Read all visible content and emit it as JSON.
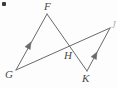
{
  "figure": {
    "type": "geometry-diagram",
    "canvas": {
      "width": 117,
      "height": 88
    },
    "background_color": "#fdfdfd",
    "stroke_color": "#6a6a6a",
    "label_color": "#4a4a4a",
    "points": [
      {
        "name": "F",
        "label": "F",
        "x": 47,
        "y": 14,
        "label_x": 44,
        "label_y": 1
      },
      {
        "name": "G",
        "label": "G",
        "x": 16,
        "y": 70,
        "label_x": 5,
        "label_y": 69
      },
      {
        "name": "H",
        "label": "H",
        "x": 69,
        "y": 47,
        "label_x": 64,
        "label_y": 50
      },
      {
        "name": "K",
        "label": "K",
        "x": 87,
        "y": 71,
        "label_x": 82,
        "label_y": 73
      },
      {
        "name": "J",
        "label": "J",
        "x": 110,
        "y": 28,
        "label_x": 111,
        "label_y": 19
      }
    ],
    "segments": [
      {
        "name": "segment-G-F",
        "from": "G",
        "to": "F",
        "x1": 16,
        "y1": 70,
        "x2": 47,
        "y2": 14
      },
      {
        "name": "segment-F-K",
        "from": "F",
        "to": "K",
        "x1": 47,
        "y1": 14,
        "x2": 87,
        "y2": 71
      },
      {
        "name": "segment-G-J",
        "from": "G",
        "to": "J",
        "x1": 16,
        "y1": 70,
        "x2": 110,
        "y2": 28
      },
      {
        "name": "segment-K-J",
        "from": "K",
        "to": "J",
        "x1": 87,
        "y1": 71,
        "x2": 110,
        "y2": 28
      }
    ],
    "arrow_marks": [
      {
        "name": "arrow-on-GF",
        "on_segment": "segment-G-F",
        "x": 31,
        "y": 42,
        "angle_deg": -61
      },
      {
        "name": "arrow-on-KJ",
        "on_segment": "segment-K-J",
        "x": 97,
        "y": 52,
        "angle_deg": -62
      }
    ],
    "artifacts": [
      {
        "name": "corner-speck",
        "x": 2,
        "y": 2,
        "width": 4,
        "height": 4,
        "color": "#3a3a3a"
      }
    ]
  }
}
